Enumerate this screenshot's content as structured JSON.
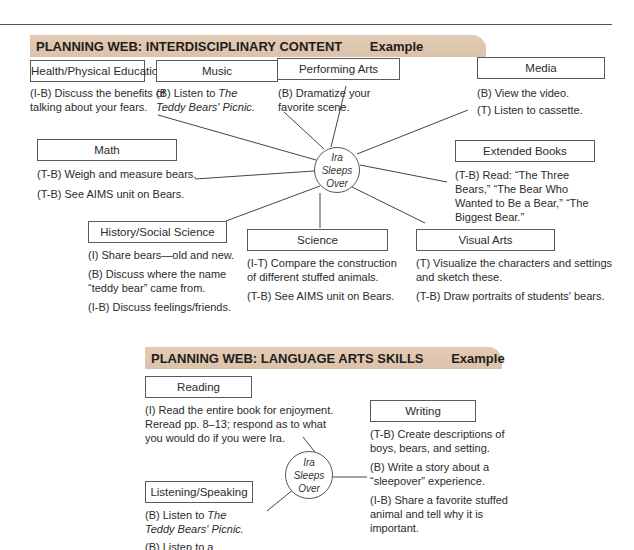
{
  "web1": {
    "title": "PLANNING WEB: INTERDISCIPLINARY CONTENT",
    "tag": "Example",
    "hub": [
      "Ira",
      "Sleeps",
      "Over"
    ],
    "categories": {
      "health": {
        "label": "Health/Physical Education",
        "items": [
          "(I-B) Discuss the benefits of talking about your fears."
        ]
      },
      "music": {
        "label": "Music",
        "items_prefix": "(B) Listen to ",
        "items_title_1": "The",
        "items_title_2": "Teddy Bears' Picnic."
      },
      "performing_arts": {
        "label": "Performing Arts",
        "items": [
          "(B) Dramatize your favorite scene."
        ]
      },
      "media": {
        "label": "Media",
        "items": [
          "(B) View the video.",
          "(T) Listen to cassette."
        ]
      },
      "math": {
        "label": "Math",
        "items": [
          "(T-B) Weigh and measure bears.",
          "(T-B) See AIMS unit on Bears."
        ]
      },
      "extended_books": {
        "label": "Extended Books",
        "items": [
          "(T-B) Read: “The Three Bears,” “The Bear Who Wanted to Be a Bear,” “The Biggest Bear.”"
        ]
      },
      "history": {
        "label": "History/Social Science",
        "items": [
          "(I) Share bears—old and new.",
          "(B) Discuss where the name “teddy bear” came from.",
          "(I-B) Discuss feelings/friends."
        ]
      },
      "science": {
        "label": "Science",
        "items": [
          "(I-T) Compare the construction of different stuffed animals.",
          "(T-B) See AIMS unit on Bears."
        ]
      },
      "visual_arts": {
        "label": "Visual Arts",
        "items": [
          "(T) Visualize the characters and settings and sketch these.",
          "(T-B) Draw portraits of students' bears."
        ]
      }
    }
  },
  "web2": {
    "title": "PLANNING WEB: LANGUAGE ARTS SKILLS",
    "tag": "Example",
    "hub": [
      "Ira",
      "Sleeps",
      "Over"
    ],
    "categories": {
      "reading": {
        "label": "Reading",
        "items": [
          "(I) Read the entire book for enjoyment. Reread pp. 8–13; respond as to what you would do if you were Ira."
        ]
      },
      "writing": {
        "label": "Writing",
        "items": [
          "(T-B) Create descriptions of boys, bears, and setting.",
          "(B) Write a story about a “sleepover” experience.",
          "(I-B) Share a favorite stuffed animal and tell why it is important."
        ]
      },
      "listening": {
        "label": "Listening/Speaking",
        "item1_prefix": "(B) Listen to ",
        "item1_title": "The Teddy Bears' Picnic.",
        "item2": "(B) Listen to a cassette"
      }
    }
  }
}
